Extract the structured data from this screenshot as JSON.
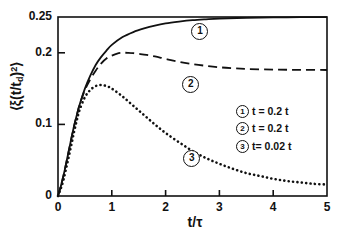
{
  "chart_data": {
    "type": "line",
    "title": "",
    "xlabel": "t/τ",
    "ylabel": "⟨ξ(t/t_d)²⟩",
    "xlim": [
      0,
      5
    ],
    "ylim": [
      0,
      0.25
    ],
    "grid": false,
    "xticks": [
      "0",
      "1",
      "2",
      "3",
      "4",
      "5"
    ],
    "xtick_values": [
      0,
      1,
      2,
      3,
      4,
      5
    ],
    "yticks": [
      "0",
      "0.1",
      "0.2",
      "0.25"
    ],
    "ytick_values": [
      0,
      0.1,
      0.2,
      0.25
    ],
    "legend_position": "center-right",
    "series": [
      {
        "name": "1",
        "label": "t = 0.2 t",
        "style": "solid",
        "marker_label": "1",
        "x": [
          0.0,
          0.05,
          0.1,
          0.15,
          0.2,
          0.25,
          0.3,
          0.35,
          0.4,
          0.5,
          0.6,
          0.7,
          0.8,
          0.9,
          1.0,
          1.2,
          1.4,
          1.6,
          1.8,
          2.0,
          2.25,
          2.5,
          2.75,
          3.0,
          3.5,
          4.0,
          4.5,
          5.0
        ],
        "y": [
          0.0,
          0.013,
          0.028,
          0.045,
          0.063,
          0.081,
          0.098,
          0.113,
          0.127,
          0.15,
          0.168,
          0.183,
          0.194,
          0.203,
          0.211,
          0.222,
          0.229,
          0.234,
          0.238,
          0.241,
          0.2435,
          0.2455,
          0.2468,
          0.2478,
          0.2489,
          0.2494,
          0.2497,
          0.2499
        ]
      },
      {
        "name": "2",
        "label": "t = 0.2 t",
        "style": "dashed",
        "marker_label": "2",
        "x": [
          0.0,
          0.05,
          0.1,
          0.15,
          0.2,
          0.25,
          0.3,
          0.35,
          0.4,
          0.5,
          0.6,
          0.7,
          0.8,
          0.9,
          1.0,
          1.1,
          1.2,
          1.3,
          1.4,
          1.6,
          1.8,
          2.0,
          2.25,
          2.5,
          2.75,
          3.0,
          3.25,
          3.5,
          4.0,
          4.5,
          5.0
        ],
        "y": [
          0.0,
          0.013,
          0.028,
          0.045,
          0.063,
          0.081,
          0.098,
          0.113,
          0.127,
          0.148,
          0.163,
          0.175,
          0.185,
          0.192,
          0.196,
          0.199,
          0.2,
          0.2,
          0.1995,
          0.1975,
          0.195,
          0.1915,
          0.1875,
          0.1843,
          0.1818,
          0.1798,
          0.1785,
          0.1775,
          0.1765,
          0.1762,
          0.176
        ]
      },
      {
        "name": "3",
        "label": "t= 0.02 t",
        "style": "dotted",
        "marker_label": "3",
        "x": [
          0.0,
          0.05,
          0.1,
          0.15,
          0.2,
          0.25,
          0.3,
          0.35,
          0.4,
          0.5,
          0.6,
          0.7,
          0.8,
          0.9,
          1.0,
          1.2,
          1.4,
          1.6,
          1.8,
          2.0,
          2.25,
          2.5,
          2.75,
          3.0,
          3.25,
          3.5,
          3.75,
          4.0,
          4.25,
          4.5,
          4.75,
          5.0
        ],
        "y": [
          0.0,
          0.01,
          0.022,
          0.038,
          0.055,
          0.072,
          0.09,
          0.106,
          0.12,
          0.138,
          0.148,
          0.1535,
          0.155,
          0.1535,
          0.15,
          0.139,
          0.126,
          0.113,
          0.1,
          0.088,
          0.075,
          0.063,
          0.053,
          0.045,
          0.038,
          0.032,
          0.028,
          0.024,
          0.021,
          0.019,
          0.017,
          0.016
        ]
      }
    ],
    "curve_markers": [
      {
        "label": "1",
        "x": 2.62,
        "y": 0.2305
      },
      {
        "label": "2",
        "x": 2.45,
        "y": 0.1565
      },
      {
        "label": "3",
        "x": 2.47,
        "y": 0.0535
      }
    ],
    "legend_entries": [
      {
        "symbol": "1",
        "text": "t = 0.2 t"
      },
      {
        "symbol": "2",
        "text": "t = 0.2 t"
      },
      {
        "symbol": "3",
        "text": "t= 0.02 t"
      }
    ]
  },
  "axes": {
    "y_label_parts": {
      "open": "⟨",
      "xi": "ξ(t/t",
      "sub": "d",
      "close": ")",
      "sup": "2",
      "end": "⟩"
    },
    "x_label": "t/τ"
  },
  "colors": {
    "background": "#ffffff",
    "ink": "#111111"
  }
}
